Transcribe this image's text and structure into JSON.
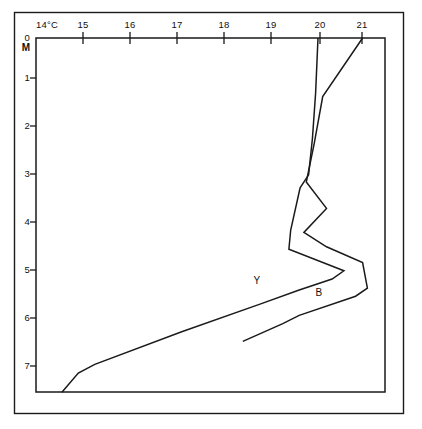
{
  "chart_data": {
    "type": "line",
    "title": "",
    "xlabel": "14°C",
    "ylabel": "0 M",
    "orientation": "depth-profile",
    "grid": false,
    "legend_position": "inline-annotation",
    "xlim": [
      14,
      21.4
    ],
    "ylim": [
      0,
      7.4
    ],
    "y_inverted": true,
    "x_ticks": [
      14,
      15,
      16,
      17,
      18,
      19,
      20,
      21
    ],
    "x_tick_labels": [
      "14°C",
      "15",
      "16",
      "17",
      "18",
      "19",
      "20",
      "21"
    ],
    "y_ticks": [
      0,
      1,
      2,
      3,
      4,
      5,
      6,
      7
    ],
    "y_tick_labels": [
      "0",
      "1",
      "2",
      "3",
      "4",
      "5",
      "6",
      "7"
    ],
    "y_axis_unit": "M",
    "series": [
      {
        "name": "Y",
        "label": "Y",
        "label_x": 18.7,
        "label_y": 5.13,
        "color": "#1a1a1a",
        "points": [
          {
            "t": 20.0,
            "d": 0.0
          },
          {
            "t": 19.95,
            "d": 1.15
          },
          {
            "t": 19.88,
            "d": 2.1
          },
          {
            "t": 19.8,
            "d": 2.85
          },
          {
            "t": 19.62,
            "d": 3.12
          },
          {
            "t": 19.42,
            "d": 4.0
          },
          {
            "t": 19.38,
            "d": 4.4
          },
          {
            "t": 20.55,
            "d": 4.85
          },
          {
            "t": 20.3,
            "d": 5.02
          },
          {
            "t": 19.6,
            "d": 5.25
          },
          {
            "t": 18.75,
            "d": 5.55
          },
          {
            "t": 17.1,
            "d": 6.12
          },
          {
            "t": 15.25,
            "d": 6.8
          },
          {
            "t": 14.9,
            "d": 6.98
          },
          {
            "t": 14.55,
            "d": 7.38
          }
        ]
      },
      {
        "name": "B",
        "label": "B",
        "label_x": 20.02,
        "label_y": 5.37,
        "color": "#1a1a1a",
        "points": [
          {
            "t": 20.95,
            "d": 0.0
          },
          {
            "t": 20.1,
            "d": 1.22
          },
          {
            "t": 19.92,
            "d": 2.2
          },
          {
            "t": 19.75,
            "d": 3.0
          },
          {
            "t": 20.18,
            "d": 3.55
          },
          {
            "t": 19.7,
            "d": 4.05
          },
          {
            "t": 20.18,
            "d": 4.35
          },
          {
            "t": 20.95,
            "d": 4.68
          },
          {
            "t": 21.05,
            "d": 5.21
          },
          {
            "t": 20.8,
            "d": 5.38
          },
          {
            "t": 19.6,
            "d": 5.78
          },
          {
            "t": 19.25,
            "d": 5.95
          },
          {
            "t": 18.4,
            "d": 6.32
          }
        ]
      }
    ]
  }
}
